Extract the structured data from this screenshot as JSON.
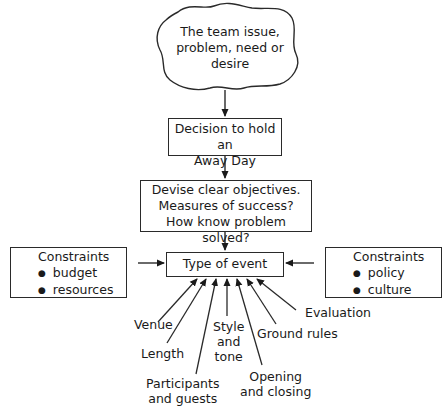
{
  "diagram": {
    "nodes": {
      "issue": {
        "lines": [
          "The team issue,",
          "problem, need or",
          "desire"
        ],
        "shape": "cloud"
      },
      "decision": {
        "lines": [
          "Decision to hold an",
          "Away Day"
        ],
        "shape": "rectangle"
      },
      "objectives": {
        "lines": [
          "Devise clear objectives.",
          "Measures of success?",
          "How know problem solved?"
        ],
        "shape": "rectangle"
      },
      "event": {
        "label": "Type of event",
        "shape": "rectangle"
      },
      "constraints_left": {
        "title": "Constraints",
        "items": [
          "budget",
          "resources"
        ]
      },
      "constraints_right": {
        "title": "Constraints",
        "items": [
          "policy",
          "culture"
        ]
      }
    },
    "inputs": [
      {
        "lines": [
          "Venue"
        ]
      },
      {
        "lines": [
          "Length"
        ]
      },
      {
        "lines": [
          "Participants",
          "and guests"
        ]
      },
      {
        "lines": [
          "Style",
          "and",
          "tone"
        ]
      },
      {
        "lines": [
          "Opening",
          "and closing"
        ]
      },
      {
        "lines": [
          "Ground rules"
        ]
      },
      {
        "lines": [
          "Evaluation"
        ]
      }
    ],
    "flow": [
      "issue -> decision",
      "decision -> objectives",
      "objectives -> event",
      "constraints_left -> event",
      "constraints_right -> event",
      "inputs -> event"
    ],
    "colors": {
      "line": "#2a2a2a",
      "background": "#ffffff"
    }
  }
}
